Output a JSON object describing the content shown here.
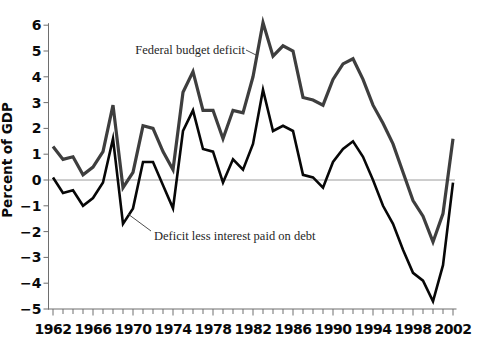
{
  "chart_data": {
    "type": "line",
    "title": "",
    "ylabel": "Percent of GDP",
    "xlabel": "",
    "xlim": [
      1962,
      2002
    ],
    "ylim": [
      -5,
      6
    ],
    "y_ticks": [
      6,
      5,
      4,
      3,
      2,
      1,
      0,
      -1,
      -2,
      -3,
      -4,
      -5
    ],
    "x_tick_labels": [
      1962,
      1966,
      1970,
      1974,
      1978,
      1982,
      1986,
      1990,
      1994,
      1998,
      2002
    ],
    "x_minor_tick_step_years": 1,
    "grid": false,
    "zero_line": true,
    "legend_position": "none (series labeled by in-plot annotations with leader lines)",
    "x": [
      1962,
      1963,
      1964,
      1965,
      1966,
      1967,
      1968,
      1969,
      1970,
      1971,
      1972,
      1973,
      1974,
      1975,
      1976,
      1977,
      1978,
      1979,
      1980,
      1981,
      1982,
      1983,
      1984,
      1985,
      1986,
      1987,
      1988,
      1989,
      1990,
      1991,
      1992,
      1993,
      1994,
      1995,
      1996,
      1997,
      1998,
      1999,
      2000,
      2001,
      2002
    ],
    "series": [
      {
        "name": "Federal budget deficit",
        "color": "#3e3e3e",
        "stroke_width": 3.2,
        "values": [
          1.3,
          0.8,
          0.9,
          0.2,
          0.5,
          1.1,
          2.9,
          -0.3,
          0.3,
          2.1,
          2.0,
          1.1,
          0.4,
          3.4,
          4.2,
          2.7,
          2.7,
          1.6,
          2.7,
          2.6,
          4.0,
          6.1,
          4.8,
          5.2,
          5.0,
          3.2,
          3.1,
          2.9,
          3.9,
          4.5,
          4.7,
          3.9,
          2.9,
          2.2,
          1.4,
          0.3,
          -0.8,
          -1.4,
          -2.4,
          -1.3,
          1.6
        ]
      },
      {
        "name": "Deficit less interest paid on debt",
        "color": "#070707",
        "stroke_width": 2.6,
        "values": [
          0.1,
          -0.5,
          -0.4,
          -1.0,
          -0.7,
          -0.1,
          1.6,
          -1.7,
          -1.1,
          0.7,
          0.7,
          -0.2,
          -1.1,
          1.9,
          2.7,
          1.2,
          1.1,
          -0.1,
          0.8,
          0.4,
          1.4,
          3.5,
          1.9,
          2.1,
          1.9,
          0.2,
          0.1,
          -0.3,
          0.7,
          1.2,
          1.5,
          0.9,
          0.0,
          -1.0,
          -1.7,
          -2.7,
          -3.6,
          -3.9,
          -4.7,
          -3.3,
          -0.1
        ]
      }
    ]
  }
}
